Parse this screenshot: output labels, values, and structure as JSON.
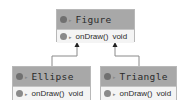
{
  "diagram": {
    "classes": [
      {
        "name": "Figure",
        "methods": [
          {
            "name": "onDraw()",
            "type": "void"
          }
        ]
      },
      {
        "name": "Ellipse",
        "methods": [
          {
            "name": "onDraw()",
            "type": "void"
          }
        ]
      },
      {
        "name": "Triangle",
        "methods": [
          {
            "name": "onDraw()",
            "type": "void"
          }
        ]
      }
    ],
    "relations": [
      {
        "from": "Ellipse",
        "to": "Figure",
        "kind": "inheritance"
      },
      {
        "from": "Triangle",
        "to": "Figure",
        "kind": "inheritance"
      }
    ],
    "icons": {
      "class": "class-icon",
      "method": "method-icon",
      "visibility": "visibility-icon"
    },
    "colors": {
      "header": "#a8a8a8",
      "body": "#f4f4f4",
      "border": "#b8b8b8",
      "line": "#888888"
    }
  }
}
